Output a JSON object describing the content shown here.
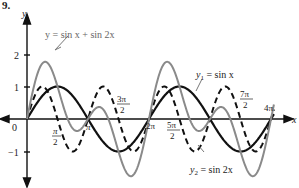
{
  "figure_number": "9.",
  "chart_data": {
    "type": "line",
    "title": "",
    "xlabel": "x",
    "ylabel": "y",
    "xlim": [
      0,
      12.566
    ],
    "ylim": [
      -1.76,
      1.76
    ],
    "grid": false,
    "x_ticks": [
      "0",
      "π/2",
      "π",
      "3π/2",
      "2π",
      "5π/2",
      "7π/2",
      "4π"
    ],
    "y_ticks": [
      "2",
      "1",
      "−1"
    ],
    "series": [
      {
        "name": "y = sin x + sin 2x",
        "style": "solid",
        "color": "#8a8a8a",
        "formula": "sin(x)+sin(2x)"
      },
      {
        "name": "y1 = sin x",
        "style": "solid",
        "color": "#111111",
        "formula": "sin(x)"
      },
      {
        "name": "y2 = sin 2x",
        "style": "dashed",
        "color": "#111111",
        "formula": "sin(2x)"
      }
    ],
    "annotations": [
      {
        "text": "y = sin x + sin 2x",
        "target": "sum curve peak near x≈0.94"
      },
      {
        "text": "y1 = sin x",
        "target": "sin x curve near x≈2.5π"
      },
      {
        "text": "y2 = sin 2x",
        "target": "sin 2x curve trough near x≈2.75π"
      }
    ]
  },
  "labels": {
    "fig": "9.",
    "y_axis": "y",
    "x_axis": "x",
    "origin": "0",
    "y2": "2",
    "y1": "1",
    "ym1": "−1",
    "pi": "π",
    "two_pi": "2π",
    "four_pi": "4π",
    "half_pi_num": "π",
    "half_pi_den": "2",
    "three_half_num": "3π",
    "three_half_den": "2",
    "five_half_num": "5π",
    "five_half_den": "2",
    "seven_half_num": "7π",
    "seven_half_den": "2",
    "sum_label": "y = sin x + sin 2x",
    "y1_label_a": "y",
    "y1_label_sub": "1",
    "y1_label_b": " = sin x",
    "y2_label_a": "y",
    "y2_label_sub": "2",
    "y2_label_b": " = sin 2x"
  }
}
